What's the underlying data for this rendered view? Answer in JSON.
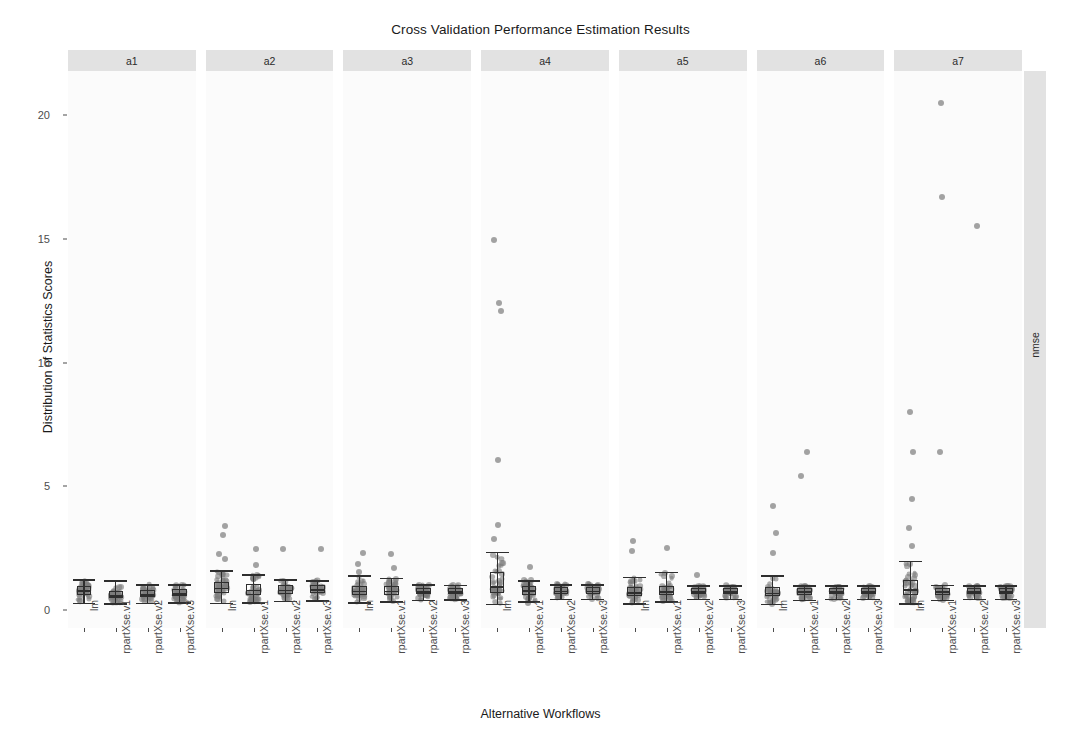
{
  "chart_data": {
    "type": "box",
    "title": "Cross Validation Performance Estimation Results",
    "xlabel": "Alternative Workflows",
    "ylabel": "Distribution of Statistics Scores",
    "metric_strip_label": "nmse",
    "ylim": [
      -0.6,
      22.2
    ],
    "yticks": [
      0,
      5,
      10,
      15,
      20
    ],
    "ytick_labels": [
      "0",
      "5",
      "10",
      "15",
      "20"
    ],
    "grid": false,
    "legend_position": "none",
    "facet_labels": [
      "a1",
      "a2",
      "a3",
      "a4",
      "a5",
      "a6",
      "a7"
    ],
    "categories": [
      "lm",
      "rpartXse.v1",
      "rpartXse.v2",
      "rpartXse.v3"
    ],
    "colors": {
      "point": "#7c7c7c",
      "box_line": "#2e2e2e",
      "strip_bg": "#e2e2e2",
      "panel_bg": "#fbfbfb",
      "text": "#1a1a1a",
      "tick_text": "#4d4d4d"
    },
    "panels": [
      {
        "facet": "a1",
        "boxes": [
          {
            "workflow": "lm",
            "min": 0.3,
            "q1": 0.62,
            "median": 0.8,
            "q3": 0.95,
            "max": 1.25,
            "outliers": []
          },
          {
            "workflow": "rpartXse.v1",
            "min": 0.28,
            "q1": 0.48,
            "median": 0.6,
            "q3": 0.78,
            "max": 1.2,
            "outliers": []
          },
          {
            "workflow": "rpartXse.v2",
            "min": 0.3,
            "q1": 0.52,
            "median": 0.65,
            "q3": 0.82,
            "max": 1.05,
            "outliers": []
          },
          {
            "workflow": "rpartXse.v3",
            "min": 0.32,
            "q1": 0.55,
            "median": 0.68,
            "q3": 0.85,
            "max": 1.05,
            "outliers": []
          }
        ]
      },
      {
        "facet": "a2",
        "boxes": [
          {
            "workflow": "lm",
            "min": 0.3,
            "q1": 0.7,
            "median": 0.9,
            "q3": 1.15,
            "max": 1.6,
            "outliers": [
              3.4,
              3.05,
              2.25,
              2.05
            ]
          },
          {
            "workflow": "rpartXse.v1",
            "min": 0.32,
            "q1": 0.62,
            "median": 0.82,
            "q3": 1.05,
            "max": 1.45,
            "outliers": [
              2.45,
              1.8
            ]
          },
          {
            "workflow": "rpartXse.v2",
            "min": 0.38,
            "q1": 0.66,
            "median": 0.82,
            "q3": 1.0,
            "max": 1.25,
            "outliers": [
              2.45
            ]
          },
          {
            "workflow": "rpartXse.v3",
            "min": 0.4,
            "q1": 0.68,
            "median": 0.84,
            "q3": 1.0,
            "max": 1.2,
            "outliers": [
              2.45
            ]
          }
        ]
      },
      {
        "facet": "a3",
        "boxes": [
          {
            "workflow": "lm",
            "min": 0.32,
            "q1": 0.62,
            "median": 0.78,
            "q3": 0.96,
            "max": 1.4,
            "outliers": [
              2.3,
              1.85,
              1.55
            ]
          },
          {
            "workflow": "rpartXse.v1",
            "min": 0.35,
            "q1": 0.62,
            "median": 0.78,
            "q3": 0.95,
            "max": 1.3,
            "outliers": [
              2.25,
              1.7
            ]
          },
          {
            "workflow": "rpartXse.v2",
            "min": 0.42,
            "q1": 0.64,
            "median": 0.76,
            "q3": 0.9,
            "max": 1.05,
            "outliers": []
          },
          {
            "workflow": "rpartXse.v3",
            "min": 0.44,
            "q1": 0.64,
            "median": 0.76,
            "q3": 0.88,
            "max": 1.02,
            "outliers": []
          }
        ]
      },
      {
        "facet": "a4",
        "boxes": [
          {
            "workflow": "lm",
            "min": 0.25,
            "q1": 0.68,
            "median": 0.95,
            "q3": 1.55,
            "max": 2.35,
            "outliers": [
              14.95,
              12.4,
              12.1,
              6.05,
              3.45,
              2.85
            ]
          },
          {
            "workflow": "rpartXse.v1",
            "min": 0.35,
            "q1": 0.62,
            "median": 0.8,
            "q3": 0.98,
            "max": 1.2,
            "outliers": [
              1.75,
              0.3
            ]
          },
          {
            "workflow": "rpartXse.v2",
            "min": 0.45,
            "q1": 0.66,
            "median": 0.78,
            "q3": 0.92,
            "max": 1.05,
            "outliers": []
          },
          {
            "workflow": "rpartXse.v3",
            "min": 0.45,
            "q1": 0.66,
            "median": 0.78,
            "q3": 0.92,
            "max": 1.05,
            "outliers": []
          }
        ]
      },
      {
        "facet": "a5",
        "boxes": [
          {
            "workflow": "lm",
            "min": 0.28,
            "q1": 0.58,
            "median": 0.72,
            "q3": 0.92,
            "max": 1.35,
            "outliers": [
              2.8,
              2.4
            ]
          },
          {
            "workflow": "rpartXse.v1",
            "min": 0.35,
            "q1": 0.6,
            "median": 0.75,
            "q3": 0.95,
            "max": 1.55,
            "outliers": [
              2.5
            ]
          },
          {
            "workflow": "rpartXse.v2",
            "min": 0.45,
            "q1": 0.64,
            "median": 0.76,
            "q3": 0.88,
            "max": 1.0,
            "outliers": [
              1.4
            ]
          },
          {
            "workflow": "rpartXse.v3",
            "min": 0.46,
            "q1": 0.64,
            "median": 0.76,
            "q3": 0.88,
            "max": 1.0,
            "outliers": []
          }
        ]
      },
      {
        "facet": "a6",
        "boxes": [
          {
            "workflow": "lm",
            "min": 0.25,
            "q1": 0.55,
            "median": 0.7,
            "q3": 0.92,
            "max": 1.4,
            "outliers": [
              4.2,
              3.1,
              2.3
            ]
          },
          {
            "workflow": "rpartXse.v1",
            "min": 0.42,
            "q1": 0.62,
            "median": 0.75,
            "q3": 0.88,
            "max": 1.0,
            "outliers": [
              6.4,
              5.4
            ]
          },
          {
            "workflow": "rpartXse.v2",
            "min": 0.45,
            "q1": 0.64,
            "median": 0.76,
            "q3": 0.88,
            "max": 1.0,
            "outliers": []
          },
          {
            "workflow": "rpartXse.v3",
            "min": 0.45,
            "q1": 0.64,
            "median": 0.76,
            "q3": 0.88,
            "max": 1.0,
            "outliers": []
          }
        ]
      },
      {
        "facet": "a7",
        "boxes": [
          {
            "workflow": "lm",
            "min": 0.28,
            "q1": 0.62,
            "median": 0.85,
            "q3": 1.2,
            "max": 2.0,
            "outliers": [
              8.0,
              6.4,
              4.5,
              3.3,
              2.6
            ]
          },
          {
            "workflow": "rpartXse.v1",
            "min": 0.42,
            "q1": 0.62,
            "median": 0.76,
            "q3": 0.9,
            "max": 1.02,
            "outliers": [
              20.5,
              16.7,
              6.4
            ]
          },
          {
            "workflow": "rpartXse.v2",
            "min": 0.45,
            "q1": 0.64,
            "median": 0.76,
            "q3": 0.88,
            "max": 1.0,
            "outliers": [
              15.5
            ]
          },
          {
            "workflow": "rpartXse.v3",
            "min": 0.45,
            "q1": 0.64,
            "median": 0.76,
            "q3": 0.88,
            "max": 1.0,
            "outliers": []
          }
        ]
      }
    ]
  },
  "layout": {
    "plot_left": 68,
    "plot_right": 1022,
    "panel_gap": 10,
    "panel_top": 71,
    "panel_bottom": 628,
    "y_pixel_at_0": 610,
    "y_pixel_per_unit": 24.75
  }
}
